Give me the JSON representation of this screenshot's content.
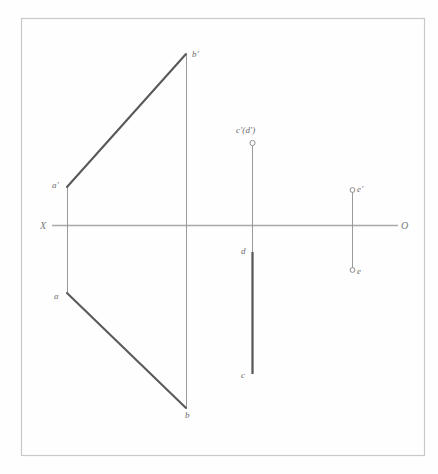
{
  "drawing": {
    "title": "Orthographic projection of lines AB, CD and E",
    "canvas": {
      "width": 438,
      "height": 474
    },
    "background_color": "#fefefe",
    "border": {
      "name": "page-border",
      "color": "#c8c8c8",
      "x": 21,
      "y": 18,
      "width": 404,
      "height": 438
    },
    "axis": {
      "name": "xo-ground-line",
      "color": "#a9a9a9",
      "y": 225,
      "x_start": 52,
      "x_end": 398,
      "left_label": "X",
      "right_label": "O"
    },
    "colors": {
      "thick_line": "#5a5a5a",
      "thin_line": "#9a9a9a",
      "axis": "#a9a9a9",
      "border": "#c8c8c8",
      "label_text": "#6b6b6b",
      "marker_stroke": "#8f8f8f"
    },
    "elements": [
      {
        "id": "line-ab",
        "kind": "oblique-line",
        "frontal_projection": {
          "label_start": "a'",
          "label_end": "b'",
          "start": {
            "x": 67,
            "y": 187
          },
          "end": {
            "x": 186,
            "y": 54
          }
        },
        "horizontal_projection": {
          "label_start": "a",
          "label_end": "b",
          "start": {
            "x": 67,
            "y": 293
          },
          "end": {
            "x": 186,
            "y": 408
          }
        },
        "connectors": [
          {
            "x": 67,
            "y_top": 187,
            "y_bottom": 293
          },
          {
            "x": 186,
            "y_top": 54,
            "y_bottom": 408
          }
        ]
      },
      {
        "id": "line-cd",
        "kind": "point-view-line",
        "frontal_projection": {
          "label": "c'(d')",
          "marker": {
            "x": 252,
            "y": 143,
            "radius": 2.6
          }
        },
        "horizontal_projection": {
          "label_top": "d",
          "label_bottom": "c",
          "start": {
            "x": 252,
            "y": 252
          },
          "end": {
            "x": 252,
            "y": 374
          }
        },
        "connectors": [
          {
            "x": 252,
            "y_top": 143,
            "y_bottom": 252
          }
        ]
      },
      {
        "id": "point-e",
        "kind": "projection-point-pair",
        "frontal_projection": {
          "label": "e'",
          "marker": {
            "x": 352,
            "y": 190,
            "radius": 2.4
          }
        },
        "horizontal_projection": {
          "label": "e",
          "marker": {
            "x": 352,
            "y": 270,
            "radius": 2.4
          }
        },
        "connectors": [
          {
            "x": 352,
            "y_top": 190,
            "y_bottom": 270
          }
        ]
      }
    ],
    "labels": [
      {
        "name": "label-b-prime",
        "text": "b'",
        "x": 192,
        "y": 54
      },
      {
        "name": "label-a-prime",
        "text": "a'",
        "x": 53,
        "y": 185
      },
      {
        "name": "label-a",
        "text": "a",
        "x": 55,
        "y": 297
      },
      {
        "name": "label-b",
        "text": "b",
        "x": 186,
        "y": 414
      },
      {
        "name": "label-c-prime-d-prime",
        "text": "c'(d')",
        "x": 236,
        "y": 132
      },
      {
        "name": "label-d",
        "text": "d",
        "x": 240,
        "y": 252
      },
      {
        "name": "label-c",
        "text": "c",
        "x": 240,
        "y": 376
      },
      {
        "name": "label-e-prime",
        "text": "e'",
        "x": 357,
        "y": 189
      },
      {
        "name": "label-e",
        "text": "e",
        "x": 357,
        "y": 273
      },
      {
        "name": "label-x-axis",
        "text": "X",
        "x": 41,
        "y": 229
      },
      {
        "name": "label-o-axis",
        "text": "O",
        "x": 401,
        "y": 229
      }
    ]
  }
}
